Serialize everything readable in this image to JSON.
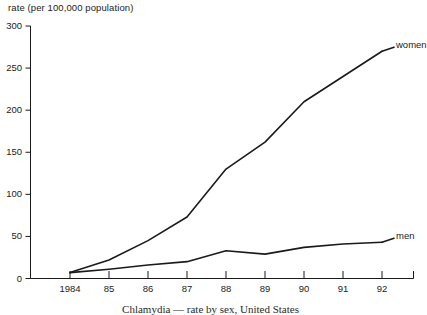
{
  "chart_data": {
    "type": "line",
    "title": "",
    "ylabel": "rate (per 100,000 population)",
    "xlabel": "",
    "categories": [
      "1984",
      "85",
      "86",
      "87",
      "88",
      "89",
      "90",
      "91",
      "92"
    ],
    "x_tick_labels": [
      "1984",
      "85",
      "86",
      "87",
      "88",
      "89",
      "90",
      "91",
      "92"
    ],
    "y_tick_labels": [
      "0",
      "50",
      "100",
      "150",
      "200",
      "250",
      "300"
    ],
    "y_ticks": [
      0,
      50,
      100,
      150,
      200,
      250,
      300
    ],
    "ylim": [
      0,
      300
    ],
    "grid": false,
    "legend_position": "line-end-labels",
    "series": [
      {
        "name": "women",
        "label": "women",
        "color": "#1a1a1a",
        "values": [
          7,
          22,
          45,
          73,
          130,
          162,
          210,
          240,
          270
        ]
      },
      {
        "name": "men",
        "label": "men",
        "color": "#1a1a1a",
        "values": [
          7,
          11,
          16,
          20,
          33,
          29,
          37,
          41,
          43
        ]
      }
    ]
  },
  "axis": {
    "y_title": "rate (per 100,000 population)"
  },
  "labels": {
    "women": "women",
    "men": "men"
  },
  "caption": {
    "text": "Chlamydia — rate by sex, United States"
  }
}
